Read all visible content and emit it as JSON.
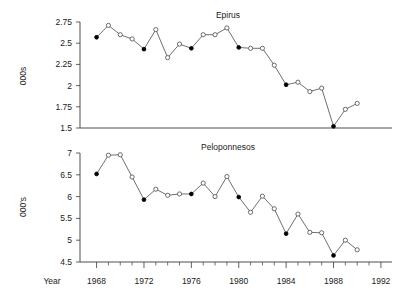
{
  "figure": {
    "width": 417,
    "height": 303,
    "background": "#ffffff",
    "line_color": "#4a4a4a",
    "text_color": "#1a1a1a",
    "axis_color": "#3a3a3a"
  },
  "shared_axis": {
    "xlabel": "Year",
    "x_tick_labels": [
      "1968",
      "1972",
      "1976",
      "1980",
      "1984",
      "1988",
      "1992"
    ],
    "x_tick_values": [
      1968,
      1972,
      1976,
      1980,
      1984,
      1988,
      1992
    ],
    "xlim": [
      1966.6,
      1992.6
    ],
    "minor_ticks": true
  },
  "chart_data": [
    {
      "type": "line",
      "title": "Epirus",
      "xlabel": "Year",
      "ylabel": "000s",
      "ylim": [
        1.5,
        2.75
      ],
      "xlim": [
        1966.6,
        1992.6
      ],
      "y_tick_labels": [
        "2.75",
        "2.5",
        "2.25",
        "2",
        "1.75",
        "1.5"
      ],
      "y_tick_values": [
        2.75,
        2.5,
        2.25,
        2,
        1.75,
        1.5
      ],
      "grid": false,
      "legend": "none",
      "marker_note": "filled markers every 4th year (census years), open circles otherwise",
      "x": [
        1968,
        1969,
        1970,
        1971,
        1972,
        1973,
        1974,
        1975,
        1976,
        1977,
        1978,
        1979,
        1980,
        1981,
        1982,
        1983,
        1984,
        1985,
        1986,
        1987,
        1988,
        1989,
        1990
      ],
      "values": [
        2.57,
        2.71,
        2.6,
        2.55,
        2.43,
        2.66,
        2.33,
        2.49,
        2.44,
        2.6,
        2.6,
        2.68,
        2.45,
        2.44,
        2.44,
        2.24,
        2.01,
        2.04,
        1.93,
        1.97,
        1.52,
        1.72,
        1.79
      ],
      "filled": [
        true,
        false,
        false,
        false,
        true,
        false,
        false,
        false,
        true,
        false,
        false,
        false,
        true,
        false,
        false,
        false,
        true,
        false,
        false,
        false,
        true,
        false,
        false
      ]
    },
    {
      "type": "line",
      "title": "Peloponnesos",
      "xlabel": "Year",
      "ylabel": "000's",
      "ylim": [
        4.5,
        7
      ],
      "xlim": [
        1966.6,
        1992.6
      ],
      "y_tick_labels": [
        "7",
        "6.5",
        "6",
        "5.5",
        "5",
        "4.5"
      ],
      "y_tick_values": [
        7,
        6.5,
        6,
        5.5,
        5,
        4.5
      ],
      "grid": false,
      "legend": "none",
      "marker_note": "filled markers every 4th year (census years), open circles otherwise",
      "x": [
        1968,
        1969,
        1970,
        1971,
        1972,
        1973,
        1974,
        1975,
        1976,
        1977,
        1978,
        1979,
        1980,
        1981,
        1982,
        1983,
        1984,
        1985,
        1986,
        1987,
        1988,
        1989,
        1990
      ],
      "values": [
        6.52,
        6.95,
        6.96,
        6.45,
        5.93,
        6.17,
        6.03,
        6.06,
        6.06,
        6.31,
        6.0,
        6.46,
        5.99,
        5.64,
        6.01,
        5.72,
        5.15,
        5.6,
        5.18,
        5.17,
        4.65,
        5.0,
        4.78
      ],
      "filled": [
        true,
        false,
        false,
        false,
        true,
        false,
        false,
        false,
        true,
        false,
        false,
        false,
        true,
        false,
        false,
        false,
        true,
        false,
        false,
        false,
        true,
        false,
        false
      ]
    }
  ]
}
